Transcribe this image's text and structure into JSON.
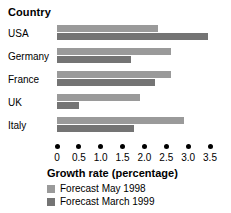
{
  "chart_data": {
    "type": "bar",
    "orientation": "horizontal",
    "title": "",
    "xlabel": "Growth rate (percentage)",
    "ylabel": "Country",
    "categories": [
      "USA",
      "Germany",
      "France",
      "UK",
      "Italy"
    ],
    "series": [
      {
        "name": "Forecast May 1998",
        "color": "#9a9a9a",
        "values": [
          2.3,
          2.6,
          2.6,
          1.9,
          2.9
        ]
      },
      {
        "name": "Forecast March 1999",
        "color": "#747474",
        "values": [
          3.45,
          1.7,
          2.25,
          0.5,
          1.75
        ]
      }
    ],
    "xlim": [
      0,
      3.5
    ],
    "xticks": [
      0,
      0.5,
      1.0,
      1.5,
      2.0,
      2.5,
      3.0,
      3.5
    ],
    "xtick_labels": [
      "0",
      "0.5",
      "1.0",
      "1.5",
      "2.0",
      "2.5",
      "3.0",
      "3.5"
    ],
    "grid": false,
    "tick_marker": "dot",
    "legend_position": "below-axis-title"
  },
  "legend": {
    "items": [
      {
        "label": "Forecast May 1998",
        "color": "#9a9a9a"
      },
      {
        "label": "Forecast March 1999",
        "color": "#747474"
      }
    ]
  }
}
